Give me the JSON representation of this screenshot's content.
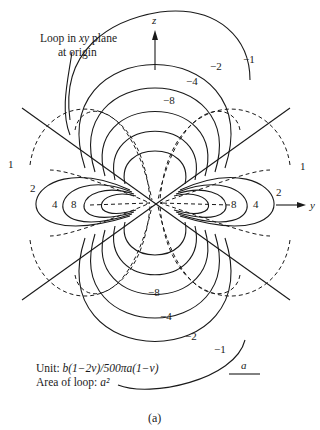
{
  "figure": {
    "axes": {
      "z_label": "z",
      "y_label": "y"
    },
    "annotation_loop": "Loop in xy plane at origin",
    "annotation_loop_line1": "Loop in ",
    "annotation_loop_xy": "xy",
    "annotation_loop_line1b": " plane",
    "annotation_loop_line2": "at origin",
    "unit_prefix": "Unit: ",
    "unit_formula": "b(1−2ν)/500πa(1−ν)",
    "area_prefix": "Area of loop: ",
    "area_value": "a²",
    "scale_bar_label": "a",
    "caption": "(a)",
    "contour_labels": {
      "top": [
        "−1",
        "−2",
        "−4",
        "−8"
      ],
      "bottom": [
        "−8",
        "−4",
        "−2",
        "−1"
      ],
      "left": [
        "1",
        "2",
        "4",
        "8"
      ],
      "right": [
        "8",
        "4",
        "2",
        "1"
      ]
    }
  }
}
